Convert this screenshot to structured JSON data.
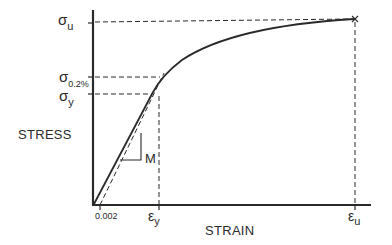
{
  "diagram": {
    "type": "stress-strain curve",
    "y_axis": {
      "title": "STRESS",
      "ticks": [
        {
          "symbol": "σ",
          "subscript": "u",
          "meaning": "ultimate stress"
        },
        {
          "symbol": "σ",
          "subscript": "0.2%",
          "meaning": "0.2% offset yield stress"
        },
        {
          "symbol": "σ",
          "subscript": "y",
          "meaning": "yield stress"
        }
      ]
    },
    "x_axis": {
      "title": "STRAIN",
      "ticks": [
        {
          "label": "0.002"
        },
        {
          "symbol": "ε",
          "subscript": "y",
          "meaning": "yield strain"
        },
        {
          "symbol": "ε",
          "subscript": "u",
          "meaning": "ultimate strain"
        }
      ]
    },
    "slope_label": "M",
    "end_marker": "×",
    "colors": {
      "line": "#2a2a2a",
      "background": "#ffffff"
    }
  }
}
